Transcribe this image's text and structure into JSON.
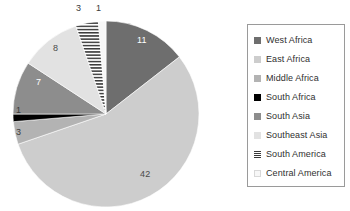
{
  "chart_data": {
    "type": "pie",
    "title": "",
    "subtitle": "",
    "xlabel": "",
    "ylabel": "",
    "grid": false,
    "legend_position": "right",
    "total": 76,
    "categories": [
      "West Africa",
      "East Africa",
      "Middle Africa",
      "South Africa",
      "South Asia",
      "Southeast Asia",
      "South America",
      "Central America"
    ],
    "values": [
      11,
      42,
      3,
      1,
      7,
      8,
      3,
      1
    ],
    "slices": [
      {
        "label": "West Africa",
        "value": 11,
        "value_text": "11",
        "color": "#6e6e6e",
        "pattern": "solid",
        "label_placement": "inside",
        "label_color": "#ffffff"
      },
      {
        "label": "East Africa",
        "value": 42,
        "value_text": "42",
        "color": "#cdcdcd",
        "pattern": "solid",
        "label_placement": "inside",
        "label_color": "#4a4a4a"
      },
      {
        "label": "Middle Africa",
        "value": 3,
        "value_text": "3",
        "color": "#b3b3b3",
        "pattern": "solid",
        "label_placement": "outside",
        "label_color": "#3b3b3b"
      },
      {
        "label": "South Africa",
        "value": 1,
        "value_text": "1",
        "color": "#000000",
        "pattern": "solid",
        "label_placement": "outside",
        "label_color": "#3b3b3b"
      },
      {
        "label": "South Asia",
        "value": 7,
        "value_text": "7",
        "color": "#8d8d8d",
        "pattern": "solid",
        "label_placement": "inside",
        "label_color": "#ffffff"
      },
      {
        "label": "Southeast Asia",
        "value": 8,
        "value_text": "8",
        "color": "#e2e2e2",
        "pattern": "solid",
        "label_placement": "inside",
        "label_color": "#4a4a4a"
      },
      {
        "label": "South America",
        "value": 3,
        "value_text": "3",
        "color": "#ffffff",
        "pattern": "horizontal-hatch",
        "label_placement": "outside",
        "label_color": "#3b3b3b"
      },
      {
        "label": "Central America",
        "value": 1,
        "value_text": "1",
        "color": "#f7f7f7",
        "pattern": "solid",
        "label_placement": "outside",
        "label_color": "#3b3b3b"
      }
    ]
  },
  "pie": {
    "value_labels": {
      "west_africa": "11",
      "east_africa": "42",
      "middle_africa": "3",
      "south_africa": "1",
      "south_asia": "7",
      "southeast_asia": "8",
      "south_america": "3",
      "central_america": "1"
    }
  },
  "legend": {
    "items": [
      {
        "label": "West Africa",
        "color": "#6e6e6e",
        "pattern": "solid"
      },
      {
        "label": "East Africa",
        "color": "#cdcdcd",
        "pattern": "solid"
      },
      {
        "label": "Middle Africa",
        "color": "#b3b3b3",
        "pattern": "solid"
      },
      {
        "label": "South Africa",
        "color": "#000000",
        "pattern": "solid"
      },
      {
        "label": "South Asia",
        "color": "#8d8d8d",
        "pattern": "solid"
      },
      {
        "label": "Southeast Asia",
        "color": "#e2e2e2",
        "pattern": "solid"
      },
      {
        "label": "South America",
        "color": "#ffffff",
        "pattern": "horizontal-hatch"
      },
      {
        "label": "Central America",
        "color": "#f7f7f7",
        "pattern": "solid"
      }
    ]
  },
  "colors": {
    "background": "#ffffff",
    "legend_border": "#9a9a9a",
    "label_dark": "#3b3b3b",
    "label_light": "#ffffff"
  }
}
